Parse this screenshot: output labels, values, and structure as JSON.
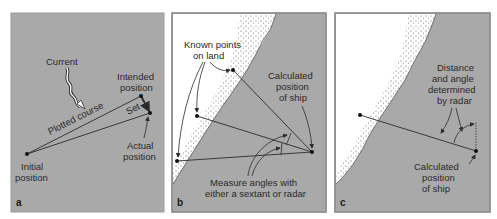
{
  "colors": {
    "water": "#a9a9a9",
    "land": "#ffffff",
    "border": "#8c8c8c",
    "line": "#2b2b2b",
    "text": "#2a2a2a"
  },
  "panels": [
    {
      "id": "a",
      "letter": "a",
      "title": "Dead reckoning with current set",
      "labels": {
        "current": "Current",
        "intended_1": "Intended",
        "intended_2": "position",
        "plotted_course": "Plotted course",
        "set": "Set",
        "actual_1": "Actual",
        "actual_2": "position",
        "initial_1": "Initial",
        "initial_2": "position"
      }
    },
    {
      "id": "b",
      "letter": "b",
      "title": "Position fix from known points on land",
      "labels": {
        "known_1": "Known points",
        "known_2": "on land",
        "calc_1": "Calculated",
        "calc_2": "position",
        "calc_3": "of ship",
        "measure_1": "Measure angles with",
        "measure_2": "either a sextant or radar"
      }
    },
    {
      "id": "c",
      "letter": "c",
      "title": "Position fix by radar range and bearing",
      "labels": {
        "dist_1": "Distance",
        "dist_2": "and angle",
        "dist_3": "determined",
        "dist_4": "by radar",
        "calc_1": "Calculated",
        "calc_2": "position",
        "calc_3": "of ship"
      }
    }
  ]
}
